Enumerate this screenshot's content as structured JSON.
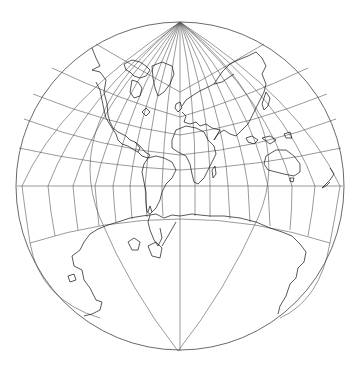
{
  "map": {
    "projection_shape": "circle",
    "center": [
      180,
      186
    ],
    "radius": 164,
    "line_color": "#444444",
    "coast_color": "#111111",
    "background": "#ffffff",
    "north_pole_point": [
      180,
      22
    ],
    "south_pole_point": [
      178,
      351
    ],
    "equator_y": 186,
    "equator_meridian_crossings_x": [
      22,
      48,
      73,
      95,
      113,
      130,
      145,
      162,
      178,
      195,
      210,
      228,
      248,
      268,
      292,
      315,
      340
    ],
    "landmasses": [
      "North America",
      "Greenland",
      "South America",
      "Europe",
      "Africa",
      "Asia",
      "Australia",
      "New Zealand",
      "Antarctica"
    ]
  }
}
